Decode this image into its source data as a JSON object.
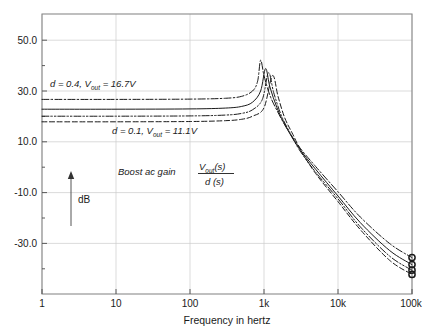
{
  "chart_data": {
    "type": "line",
    "title": "",
    "xlabel": "Frequency in hertz",
    "ylabel": "dB",
    "xscale": "log",
    "xlim": [
      1,
      100000
    ],
    "ylim": [
      -40,
      60
    ],
    "xticks": [
      "1",
      "10",
      "100",
      "1k",
      "10k",
      "100k"
    ],
    "xtick_values": [
      1,
      10,
      100,
      1000,
      10000,
      100000
    ],
    "yticks": [
      "50.0",
      "30.0",
      "10.0",
      "-10.0",
      "-30.0"
    ],
    "ytick_values": [
      50,
      30,
      10,
      -10,
      -30
    ],
    "grid": true,
    "legend": "none",
    "annotations": [
      {
        "name": "upper-duty-annotation",
        "text_d": "d",
        "text_eq1": " = 0.4, ",
        "text_v": "V",
        "text_sub": "out",
        "text_eq2": " = 16.7",
        "text_unit": "V",
        "full": "d = 0.4, Vout = 16.7V"
      },
      {
        "name": "lower-duty-annotation",
        "text_d": "d",
        "text_eq1": " = 0.1, ",
        "text_v": "V",
        "text_sub": "out",
        "text_eq2": " = 11.1",
        "text_unit": "V",
        "full": "d = 0.1, Vout = 11.1V"
      },
      {
        "name": "transfer-function-annotation",
        "label": "Boost ac gain",
        "numerator_v": "V",
        "numerator_sub": "out",
        "numerator_s": "(s)",
        "denominator": "d (s)",
        "full": "Boost ac gain Vout(s) / d(s)"
      },
      {
        "name": "db-axis-arrow-label",
        "label": "dB"
      }
    ],
    "series": [
      {
        "name": "d = 0.4, Vout = 16.7V",
        "style": "dash-dot",
        "low_freq_gain_db": 29.5,
        "peak_db": 43.5,
        "peak_freq_hz": 900,
        "end_db": -27.0,
        "points": [
          [
            1,
            29.5
          ],
          [
            10,
            29.5
          ],
          [
            100,
            29.6
          ],
          [
            300,
            29.9
          ],
          [
            500,
            30.6
          ],
          [
            700,
            32.5
          ],
          [
            820,
            36.0
          ],
          [
            900,
            43.5
          ],
          [
            1000,
            38.0
          ],
          [
            1200,
            31.0
          ],
          [
            1500,
            25.5
          ],
          [
            2000,
            19.5
          ],
          [
            3000,
            12.5
          ],
          [
            5000,
            5.5
          ],
          [
            10000,
            -3.5
          ],
          [
            20000,
            -12.5
          ],
          [
            50000,
            -22.0
          ],
          [
            100000,
            -27.0
          ]
        ]
      },
      {
        "name": "series-2",
        "style": "solid",
        "low_freq_gain_db": 26.0,
        "peak_db": 40.5,
        "peak_freq_hz": 1050,
        "end_db": -29.5,
        "points": [
          [
            1,
            26.0
          ],
          [
            10,
            26.0
          ],
          [
            100,
            26.1
          ],
          [
            300,
            26.4
          ],
          [
            500,
            27.0
          ],
          [
            700,
            28.5
          ],
          [
            900,
            32.5
          ],
          [
            1050,
            40.5
          ],
          [
            1200,
            34.0
          ],
          [
            1500,
            26.5
          ],
          [
            2000,
            19.5
          ],
          [
            3000,
            12.0
          ],
          [
            5000,
            4.5
          ],
          [
            10000,
            -5.0
          ],
          [
            20000,
            -14.5
          ],
          [
            50000,
            -24.5
          ],
          [
            100000,
            -29.5
          ]
        ]
      },
      {
        "name": "series-3",
        "style": "dash-dot-dot",
        "low_freq_gain_db": 23.5,
        "peak_db": 39.0,
        "peak_freq_hz": 1150,
        "end_db": -31.5,
        "points": [
          [
            1,
            23.5
          ],
          [
            10,
            23.5
          ],
          [
            100,
            23.6
          ],
          [
            300,
            23.9
          ],
          [
            500,
            24.5
          ],
          [
            700,
            25.8
          ],
          [
            950,
            29.5
          ],
          [
            1150,
            39.0
          ],
          [
            1350,
            32.0
          ],
          [
            1700,
            24.0
          ],
          [
            2200,
            18.0
          ],
          [
            3000,
            11.5
          ],
          [
            5000,
            3.5
          ],
          [
            10000,
            -6.0
          ],
          [
            20000,
            -16.0
          ],
          [
            50000,
            -26.5
          ],
          [
            100000,
            -31.5
          ]
        ]
      },
      {
        "name": "d = 0.1, Vout = 11.1V",
        "style": "dashed",
        "low_freq_gain_db": 21.5,
        "peak_db": 38.0,
        "peak_freq_hz": 1300,
        "end_db": -33.0,
        "points": [
          [
            1,
            21.5
          ],
          [
            10,
            21.5
          ],
          [
            100,
            21.6
          ],
          [
            300,
            21.9
          ],
          [
            500,
            22.4
          ],
          [
            700,
            23.5
          ],
          [
            1000,
            26.5
          ],
          [
            1300,
            38.0
          ],
          [
            1550,
            30.5
          ],
          [
            1900,
            23.0
          ],
          [
            2400,
            17.5
          ],
          [
            3200,
            11.0
          ],
          [
            5000,
            3.0
          ],
          [
            10000,
            -7.0
          ],
          [
            20000,
            -17.0
          ],
          [
            50000,
            -28.0
          ],
          [
            100000,
            -33.0
          ]
        ]
      }
    ],
    "endpoint_markers": {
      "shape": "circle",
      "count": 4,
      "values_db": [
        -27.0,
        -29.5,
        -31.5,
        -33.0
      ],
      "freq_hz": 100000
    },
    "colors": {
      "curve": "#1a1a1a",
      "grid": "#c8c8c8",
      "frame": "#808080",
      "text": "#1a1a1a",
      "background": "#ffffff"
    }
  }
}
